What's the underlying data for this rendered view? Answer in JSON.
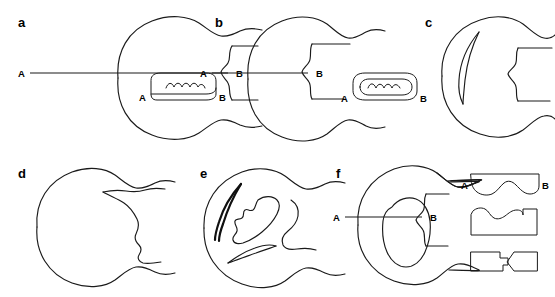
{
  "figure": {
    "type": "line-drawing-diagram",
    "background_color": "#ffffff",
    "stroke_color": "#1a1a1a",
    "width": 555,
    "height": 297,
    "panel_count": 6
  },
  "panels": [
    {
      "id": "a",
      "label": "a",
      "has_section_line": true,
      "section_start_label": "A",
      "section_end_label": "B",
      "inset": {
        "present": true,
        "shape": "elongated-rounded-slab-with-wavy-interior",
        "start_label": "A",
        "end_label": "B"
      },
      "interior_features": []
    },
    {
      "id": "b",
      "label": "b",
      "has_section_line": true,
      "section_start_label": "A",
      "section_end_label": "B",
      "inset": {
        "present": true,
        "shape": "rounded-pill-with-wavy-interior",
        "start_label": "A",
        "end_label": "B"
      },
      "interior_features": []
    },
    {
      "id": "c",
      "label": "c",
      "has_section_line": false,
      "section_start_label": "",
      "section_end_label": "",
      "inset": {
        "present": false,
        "shape": "",
        "start_label": "",
        "end_label": ""
      },
      "interior_features": [
        "crescent-sliver"
      ]
    },
    {
      "id": "d",
      "label": "d",
      "has_section_line": false,
      "section_start_label": "",
      "section_end_label": "",
      "inset": {
        "present": false,
        "shape": "",
        "start_label": "",
        "end_label": ""
      },
      "interior_features": [
        "branching-irregular-channel"
      ]
    },
    {
      "id": "e",
      "label": "e",
      "has_section_line": false,
      "section_start_label": "",
      "section_end_label": "",
      "inset": {
        "present": false,
        "shape": "",
        "start_label": "",
        "end_label": ""
      },
      "interior_features": [
        "thick-crescent-sliver",
        "jagged-blob",
        "elongated-sliver"
      ]
    },
    {
      "id": "f",
      "label": "f",
      "has_section_line": true,
      "section_start_label": "A",
      "section_end_label": "B",
      "inset": {
        "present": true,
        "shape": "three-stacked-cross-sections",
        "start_label": "A",
        "end_label": "B"
      },
      "interior_features": [
        "central-rounded-blob"
      ],
      "cross_sections": [
        {
          "index": 1,
          "shape": "slab-with-broad-wavy-concavity",
          "start_label": "A",
          "end_label": "B"
        },
        {
          "index": 2,
          "shape": "slab-with-deep-central-notch",
          "start_label": "",
          "end_label": ""
        },
        {
          "index": 3,
          "shape": "split-slab-with-wedge-gap",
          "start_label": "",
          "end_label": ""
        }
      ]
    }
  ]
}
